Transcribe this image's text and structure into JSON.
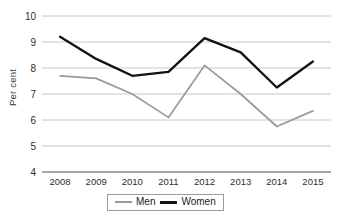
{
  "chart_data": {
    "type": "line",
    "title": "",
    "subtitle": "",
    "xlabel": "",
    "ylabel": "Per cent",
    "categories": [
      "2008",
      "2009",
      "2010",
      "2011",
      "2012",
      "2013",
      "2014",
      "2015"
    ],
    "x": [
      2008,
      2009,
      2010,
      2011,
      2012,
      2013,
      2014,
      2015
    ],
    "ylim": [
      4,
      10
    ],
    "yticks": [
      "4",
      "5",
      "6",
      "7",
      "8",
      "9",
      "10"
    ],
    "ytick_values": [
      4,
      5,
      6,
      7,
      8,
      9,
      10
    ],
    "grid": true,
    "grid_axis": "y",
    "legend_position": "bottom-center",
    "series": [
      {
        "name": "Men",
        "color": "#9a9a9a",
        "values": [
          7.7,
          7.6,
          7.0,
          6.1,
          8.1,
          7.0,
          5.75,
          6.35
        ]
      },
      {
        "name": "Women",
        "color": "#111111",
        "values": [
          9.2,
          8.35,
          7.7,
          7.85,
          9.15,
          8.6,
          7.25,
          8.25
        ]
      }
    ]
  },
  "axis": {
    "y_label": "Per cent"
  },
  "legend": {
    "items": [
      {
        "label": "Men",
        "swatch": "line-swatch-gray"
      },
      {
        "label": "Women",
        "swatch": "line-swatch-black"
      }
    ]
  },
  "colors": {
    "men_line": "#9a9a9a",
    "women_line": "#111111",
    "gridline": "#c8c8c8",
    "axis_line": "#8a8a8a",
    "text": "#2e2e2e",
    "background": "#ffffff"
  }
}
